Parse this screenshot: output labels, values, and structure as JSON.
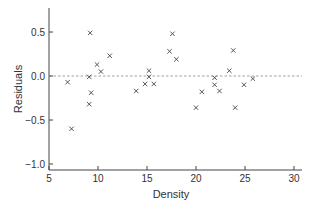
{
  "chart_data": {
    "type": "scatter",
    "title": "",
    "xlabel": "Density",
    "ylabel": "Residuals",
    "xlim": [
      5,
      30.5
    ],
    "ylim": [
      -1.05,
      0.78
    ],
    "xticks": [
      5,
      10,
      15,
      20,
      25,
      30
    ],
    "xtick_labels": [
      "5",
      "10",
      "15",
      "20",
      "25",
      "30"
    ],
    "yticks": [
      0.5,
      0.0,
      -0.5,
      -1.0
    ],
    "ytick_labels": [
      "0.5",
      "0.0",
      "-0.5",
      "-1.0"
    ],
    "marker": "x",
    "reference_line": {
      "y": 0.0,
      "style": "dashed"
    },
    "grid": false,
    "legend": "none",
    "points": [
      {
        "x": 9.2,
        "y": 0.49
      },
      {
        "x": 11.2,
        "y": 0.23
      },
      {
        "x": 9.9,
        "y": 0.13
      },
      {
        "x": 10.3,
        "y": 0.05
      },
      {
        "x": 9.1,
        "y": -0.01
      },
      {
        "x": 6.9,
        "y": -0.07
      },
      {
        "x": 9.3,
        "y": -0.19
      },
      {
        "x": 9.1,
        "y": -0.32
      },
      {
        "x": 7.3,
        "y": -0.6
      },
      {
        "x": 17.6,
        "y": 0.48
      },
      {
        "x": 17.3,
        "y": 0.28
      },
      {
        "x": 18.0,
        "y": 0.19
      },
      {
        "x": 15.2,
        "y": 0.06
      },
      {
        "x": 15.2,
        "y": -0.01
      },
      {
        "x": 14.8,
        "y": -0.09
      },
      {
        "x": 15.7,
        "y": -0.09
      },
      {
        "x": 13.9,
        "y": -0.17
      },
      {
        "x": 23.8,
        "y": 0.29
      },
      {
        "x": 23.4,
        "y": 0.06
      },
      {
        "x": 21.9,
        "y": -0.02
      },
      {
        "x": 25.8,
        "y": -0.03
      },
      {
        "x": 21.9,
        "y": -0.1
      },
      {
        "x": 24.9,
        "y": -0.1
      },
      {
        "x": 20.6,
        "y": -0.18
      },
      {
        "x": 22.4,
        "y": -0.17
      },
      {
        "x": 20.0,
        "y": -0.36
      },
      {
        "x": 24.0,
        "y": -0.36
      }
    ]
  }
}
